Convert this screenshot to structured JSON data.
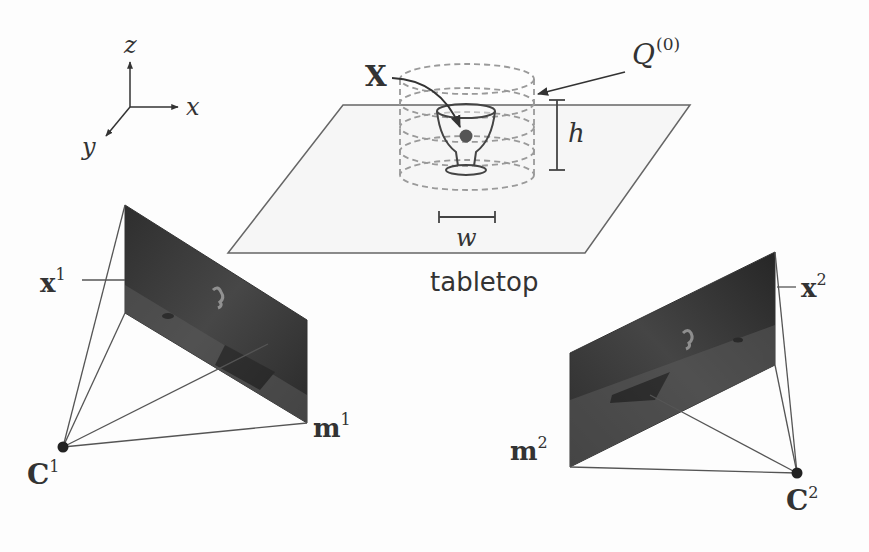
{
  "figure": {
    "type": "multi-view camera geometry diagram",
    "axes": {
      "x_label": "x",
      "y_label": "y",
      "z_label": "z"
    },
    "scene": {
      "surface_label": "tabletop",
      "object": "glass",
      "point_label": "X",
      "volume_label": "Q",
      "volume_superscript": "(0)",
      "height_label": "h",
      "width_label": "w"
    },
    "cameras": [
      {
        "center_label": "C",
        "index": "1",
        "image_point_label": "x",
        "plane_corner_label": "m"
      },
      {
        "center_label": "C",
        "index": "2",
        "image_point_label": "x",
        "plane_corner_label": "m"
      }
    ],
    "colors": {
      "line": "#555555",
      "tabletop_fill": "#f7f7f7",
      "dashed": "#9a9a9a",
      "image_plane": "#3a3a3a",
      "point": "#555555"
    }
  }
}
